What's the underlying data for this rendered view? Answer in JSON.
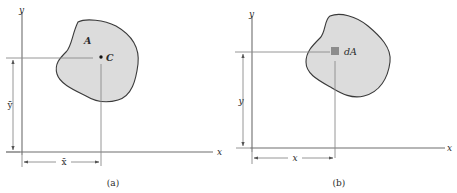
{
  "figure": {
    "panels": [
      {
        "id": "a",
        "caption": "(a)",
        "x_axis_label": "x",
        "y_axis_label": "y",
        "region_label": "A",
        "point_label": "C",
        "point_description": "centroid",
        "x_dimension_label": "x̄",
        "y_dimension_label": "ȳ"
      },
      {
        "id": "b",
        "caption": "(b)",
        "x_axis_label": "x",
        "y_axis_label": "y",
        "element_label": "dA",
        "element_description": "differential area element",
        "x_dimension_label": "x",
        "y_dimension_label": "y"
      }
    ],
    "colors": {
      "region_fill": "#dcdcdc",
      "region_outline": "#3a3a3a",
      "element_fill": "#8c8c8c",
      "lines": "#6e6e6e"
    }
  }
}
